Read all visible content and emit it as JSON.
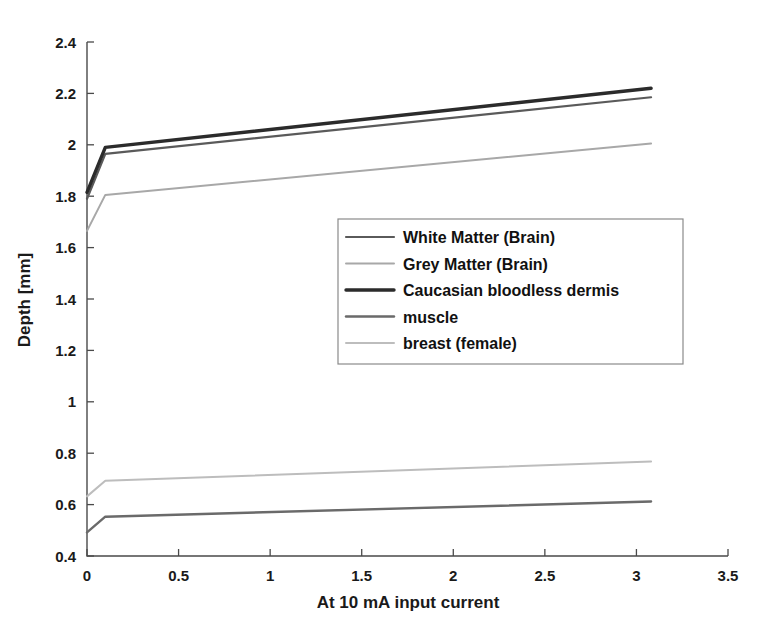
{
  "chart_data": {
    "type": "line",
    "title": "",
    "xlabel": "At 10 mA input current",
    "ylabel": "Depth [mm]",
    "xlim": [
      0,
      3.5
    ],
    "ylim": [
      0.4,
      2.4
    ],
    "xticks": [
      "0",
      "0.5",
      "1",
      "1.5",
      "2",
      "2.5",
      "3",
      "3.5"
    ],
    "xtick_values": [
      0,
      0.5,
      1,
      1.5,
      2,
      2.5,
      3,
      3.5
    ],
    "yticks": [
      "0.4",
      "0.6",
      "0.8",
      "1",
      "1.2",
      "1.4",
      "1.6",
      "1.8",
      "2",
      "2.2",
      "2.4"
    ],
    "ytick_values": [
      0.4,
      0.6,
      0.8,
      1.0,
      1.2,
      1.4,
      1.6,
      1.8,
      2.0,
      2.2,
      2.4
    ],
    "grid": false,
    "legend_position": "center-right",
    "series": [
      {
        "name": "White Matter (Brain)",
        "color": "#5a5a5a",
        "width": 2.2,
        "x": [
          0,
          0.1,
          3.08
        ],
        "values": [
          1.79,
          1.965,
          2.185
        ]
      },
      {
        "name": "Grey Matter (Brain)",
        "color": "#a8a8a8",
        "width": 2.0,
        "x": [
          0,
          0.1,
          3.08
        ],
        "values": [
          1.665,
          1.805,
          2.005
        ]
      },
      {
        "name": "Caucasian bloodless dermis",
        "color": "#2b2b2b",
        "width": 3.4,
        "x": [
          0,
          0.1,
          3.08
        ],
        "values": [
          1.815,
          1.99,
          2.22
        ]
      },
      {
        "name": "muscle",
        "color": "#6a6a6a",
        "width": 2.4,
        "x": [
          0,
          0.1,
          3.08
        ],
        "values": [
          0.492,
          0.553,
          0.612
        ]
      },
      {
        "name": "breast (female)",
        "color": "#bdbdbd",
        "width": 2.0,
        "x": [
          0,
          0.1,
          3.08
        ],
        "values": [
          0.632,
          0.693,
          0.768
        ]
      }
    ]
  },
  "axes": {
    "x_title": "At 10 mA input current",
    "y_title": "Depth [mm]"
  },
  "legend": {
    "items": [
      {
        "label": "White Matter (Brain)"
      },
      {
        "label": "Grey Matter (Brain)"
      },
      {
        "label": "Caucasian bloodless dermis"
      },
      {
        "label": "muscle"
      },
      {
        "label": "breast (female)"
      }
    ]
  }
}
